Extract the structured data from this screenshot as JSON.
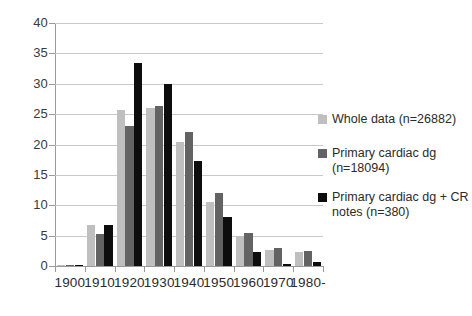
{
  "chart_data": {
    "type": "bar",
    "title": "",
    "subtitle": "",
    "xlabel": "",
    "ylabel": "",
    "categories": [
      "1900",
      "1910",
      "1920",
      "1930",
      "1940",
      "1950",
      "1960",
      "1970",
      "1980-"
    ],
    "series": [
      {
        "name": "Whole data (n=26882)",
        "color": "#bfbfbf",
        "values": [
          0.1,
          6.8,
          25.7,
          26.0,
          20.4,
          10.5,
          5.0,
          2.7,
          2.3
        ]
      },
      {
        "name": "Primary cardiac dg (n=18094)",
        "color": "#636363",
        "values": [
          0.1,
          5.2,
          23.0,
          26.4,
          22.0,
          12.0,
          5.5,
          3.0,
          2.4
        ]
      },
      {
        "name": "Primary cardiac dg + CR notes (n=380)",
        "color": "#0d0d0d",
        "values": [
          0.2,
          6.8,
          33.5,
          29.9,
          17.3,
          8.0,
          2.3,
          0.4,
          0.7
        ]
      }
    ],
    "ylim": [
      0,
      40
    ],
    "ytick_step": 5,
    "yticks": [
      "0",
      "5",
      "10",
      "15",
      "20",
      "25",
      "30",
      "35",
      "40"
    ],
    "grid": true,
    "legend_position": "right"
  },
  "legend": {
    "entries": [
      {
        "label": "Whole data (n=26882)",
        "line1": "Whole data (n=26882)",
        "line2": ""
      },
      {
        "label": "Primary cardiac dg (n=18094)",
        "line1": "Primary cardiac dg",
        "line2": "(n=18094)"
      },
      {
        "label": "Primary cardiac dg + CR notes (n=380)",
        "line1": "Primary cardiac dg + CR",
        "line2": "notes (n=380)"
      }
    ]
  }
}
